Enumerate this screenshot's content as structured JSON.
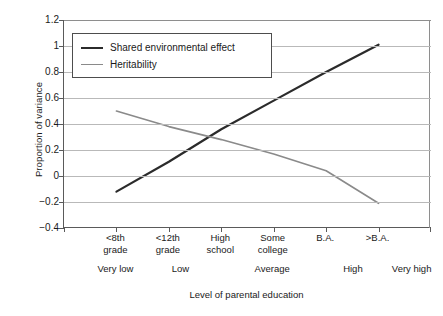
{
  "chart_data": {
    "type": "line",
    "title": "",
    "xlabel": "Level of parental education",
    "ylabel": "Proportion of variance",
    "ylim": [
      -0.4,
      1.2
    ],
    "ytick_labels": [
      "1.2",
      "1",
      "0.8",
      "0.6",
      "0.4",
      "0.2",
      "0",
      "-0.2",
      "-0.4"
    ],
    "ytick_values": [
      1.2,
      1.0,
      0.8,
      0.6,
      0.4,
      0.2,
      0,
      -0.2,
      -0.4
    ],
    "grid": true,
    "legend_position": "top-left",
    "categories": [
      "<8th grade",
      "<12th grade",
      "High school",
      "Some college",
      "B.A.",
      ">B.A."
    ],
    "category_lines": [
      [
        "<8th",
        "grade"
      ],
      [
        "<12th",
        "grade"
      ],
      [
        "High",
        "school"
      ],
      [
        "Some",
        "college"
      ],
      [
        "B.A.",
        ""
      ],
      [
        ">B.A.",
        ""
      ]
    ],
    "group_labels": [
      {
        "label": "Very low",
        "center_pct": 14.3
      },
      {
        "label": "Low",
        "center_pct": 32.0
      },
      {
        "label": "Average",
        "center_pct": 57.0
      },
      {
        "label": "High",
        "center_pct": 79.0
      },
      {
        "label": "Very high",
        "center_pct": 95.0
      }
    ],
    "series": [
      {
        "name": "Shared environmental effect",
        "color": "#2b2b2b",
        "width": 2.2,
        "values": [
          -0.12,
          0.11,
          0.36,
          0.58,
          0.8,
          1.01
        ]
      },
      {
        "name": "Heritability",
        "color": "#8a8a8a",
        "width": 1.6,
        "values": [
          0.5,
          0.38,
          0.28,
          0.17,
          0.04,
          -0.21
        ]
      }
    ]
  },
  "legend": {
    "items": [
      {
        "label": "Shared environmental effect"
      },
      {
        "label": "Heritability"
      }
    ]
  },
  "axis": {
    "y_title": "Proportion of variance",
    "x_title": "Level of parental education"
  },
  "colors": {
    "series_shared": "#2b2b2b",
    "series_heritability": "#8a8a8a",
    "gridline": "#b9b9b9",
    "axis": "#5a5a5a",
    "background": "#ffffff"
  }
}
